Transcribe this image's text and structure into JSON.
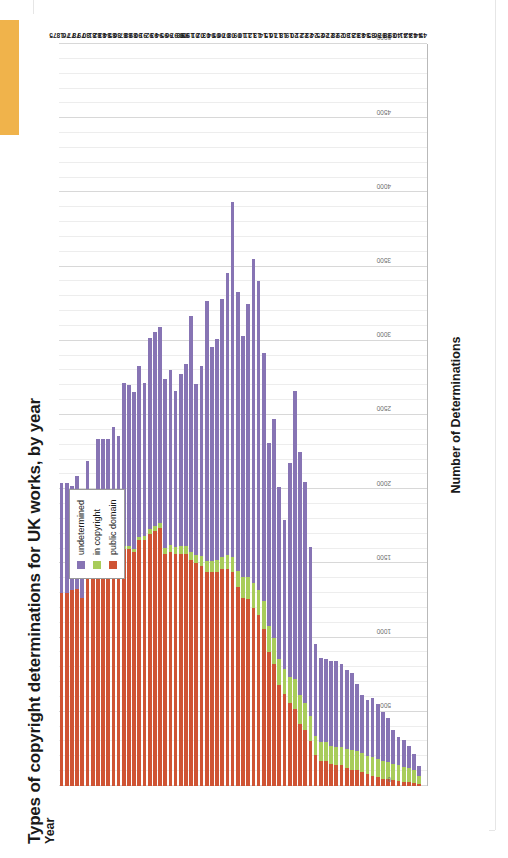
{
  "page": {
    "orange_tab_color": "#F0B34B",
    "background": "#ffffff"
  },
  "chart_data": {
    "type": "bar",
    "orientation": "vertical-stacked",
    "title": "Types of copyright determinations for UK works, by year",
    "xlabel": "Year",
    "ylabel": "Number of Determinations",
    "ylim": [
      0,
      5000
    ],
    "yticks": [
      0,
      500,
      1000,
      1500,
      2000,
      2500,
      3000,
      3500,
      4000,
      4500,
      5000
    ],
    "ytick_labels": [
      "0",
      "500",
      "1000",
      "1500",
      "2000",
      "2500",
      "3000",
      "3500",
      "4000",
      "4500",
      "5000"
    ],
    "grid": true,
    "legend_position": "top-left-inside",
    "legend": [
      {
        "name": "undetermined",
        "color": "#8774B4"
      },
      {
        "name": "in copyright",
        "color": "#A8CC5A"
      },
      {
        "name": "public domain",
        "color": "#CF5434"
      }
    ],
    "stack_order_from_zero": [
      "public domain",
      "in copyright",
      "undetermined"
    ],
    "categories": [
      "1875",
      "76",
      "77",
      "78",
      "79",
      "80",
      "81",
      "82",
      "83",
      "84",
      "85",
      "86",
      "87",
      "88",
      "89",
      "90",
      "91",
      "92",
      "93",
      "94",
      "95",
      "96",
      "97",
      "98",
      "99",
      "1900",
      "01",
      "02",
      "03",
      "04",
      "05",
      "06",
      "07",
      "08",
      "09",
      "10",
      "11",
      "12",
      "13",
      "14",
      "15",
      "16",
      "17",
      "18",
      "19",
      "20",
      "21",
      "22",
      "23",
      "24",
      "25",
      "26",
      "27",
      "28",
      "29",
      "30",
      "31",
      "32",
      "33",
      "34",
      "35",
      "36",
      "37",
      "38",
      "39",
      "40",
      "41",
      "42",
      "43",
      "44",
      "45"
    ],
    "series": [
      {
        "name": "public domain",
        "color": "#CF5434",
        "values": [
          1300,
          1300,
          1320,
          1330,
          1270,
          1430,
          1460,
          1580,
          1580,
          1580,
          1620,
          1560,
          1600,
          1600,
          1580,
          1660,
          1660,
          1700,
          1720,
          1740,
          1560,
          1580,
          1560,
          1560,
          1560,
          1520,
          1500,
          1480,
          1440,
          1440,
          1440,
          1460,
          1460,
          1440,
          1340,
          1270,
          1260,
          1200,
          1150,
          1060,
          900,
          820,
          680,
          620,
          560,
          520,
          420,
          380,
          300,
          210,
          170,
          170,
          150,
          140,
          140,
          120,
          110,
          110,
          95,
          80,
          70,
          60,
          50,
          45,
          40,
          35,
          30,
          25,
          20,
          12,
          0
        ]
      },
      {
        "name": "in copyright",
        "color": "#A8CC5A",
        "values": [
          0,
          0,
          0,
          0,
          0,
          0,
          0,
          0,
          0,
          0,
          0,
          8,
          15,
          15,
          15,
          20,
          25,
          30,
          30,
          35,
          45,
          45,
          50,
          55,
          55,
          60,
          60,
          70,
          75,
          75,
          80,
          85,
          95,
          105,
          110,
          140,
          150,
          170,
          170,
          185,
          180,
          180,
          175,
          170,
          175,
          200,
          190,
          180,
          170,
          130,
          125,
          125,
          120,
          125,
          125,
          130,
          130,
          125,
          125,
          120,
          125,
          125,
          120,
          115,
          110,
          105,
          100,
          95,
          85,
          55,
          0
        ]
      },
      {
        "name": "undetermined",
        "color": "#8774B4",
        "values": [
          740,
          740,
          700,
          760,
          680,
          760,
          540,
          760,
          760,
          760,
          800,
          790,
          1100,
          1090,
          1060,
          1150,
          1030,
          1290,
          1310,
          1320,
          1140,
          1180,
          1050,
          1160,
          1230,
          1590,
          1150,
          1280,
          1750,
          1440,
          1490,
          1740,
          1900,
          2390,
          1880,
          1620,
          1840,
          2180,
          2080,
          1670,
          1230,
          1470,
          1160,
          1000,
          1440,
          1940,
          1640,
          1490,
          1140,
          620,
          570,
          560,
          570,
          580,
          560,
          530,
          520,
          450,
          390,
          380,
          400,
          370,
          330,
          300,
          230,
          190,
          180,
          150,
          110,
          65,
          0
        ]
      }
    ]
  }
}
